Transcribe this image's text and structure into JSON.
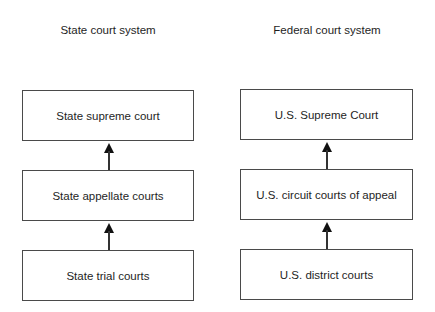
{
  "columns": [
    {
      "title": "State court system",
      "levels": [
        {
          "label": "State supreme court"
        },
        {
          "label": "State appellate courts"
        },
        {
          "label": "State trial courts"
        }
      ]
    },
    {
      "title": "Federal court system",
      "levels": [
        {
          "label": "U.S. Supreme Court"
        },
        {
          "label": "U.S. circuit courts of appeal"
        },
        {
          "label": "U.S. district courts"
        }
      ]
    }
  ],
  "colors": {
    "border": "#4a4a4a",
    "arrow": "#111111",
    "text": "#1e1e1e",
    "background": "#ffffff"
  }
}
